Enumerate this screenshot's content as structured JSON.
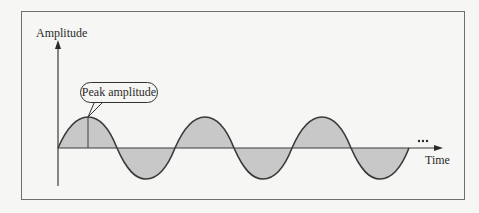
{
  "diagram": {
    "y_axis_label": "Amplitude",
    "x_axis_label": "Time",
    "callout": "Peak amplitude",
    "continuation": "...",
    "fill_color": "#c8c8c8",
    "line_color": "#3a3a3a"
  }
}
